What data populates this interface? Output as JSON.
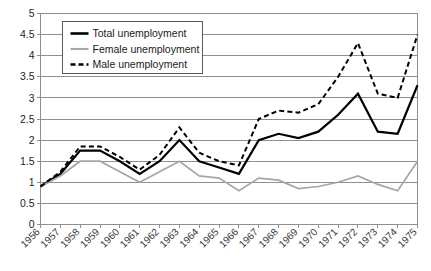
{
  "chart_data": {
    "type": "line",
    "title": "",
    "xlabel": "",
    "ylabel": "",
    "ylim": [
      0,
      5
    ],
    "ytick_step": 0.5,
    "grid": true,
    "legend_position": "top-left-inside",
    "categories": [
      "1956",
      "1957",
      "1958",
      "1959",
      "1960",
      "1961",
      "1962",
      "1963",
      "1964",
      "1965",
      "1966",
      "1967",
      "1968",
      "1969",
      "1970",
      "1971",
      "1972",
      "1973",
      "1974",
      "1975"
    ],
    "yticks": [
      "0",
      "0.5",
      "1",
      "1.5",
      "2",
      "2.5",
      "3",
      "3.5",
      "4",
      "4.5",
      "5"
    ],
    "series": [
      {
        "name": "Total unemployment",
        "color": "#000000",
        "style": "solid",
        "width": 2.2,
        "values": [
          0.9,
          1.2,
          1.75,
          1.75,
          1.5,
          1.2,
          1.5,
          2.0,
          1.5,
          1.35,
          1.2,
          2.0,
          2.15,
          2.05,
          2.2,
          2.6,
          3.1,
          2.2,
          2.15,
          3.3
        ]
      },
      {
        "name": "Female unemployment",
        "color": "#a6a6a6",
        "style": "solid",
        "width": 1.7,
        "values": [
          0.9,
          1.15,
          1.5,
          1.5,
          1.25,
          1.0,
          1.25,
          1.5,
          1.15,
          1.1,
          0.8,
          1.1,
          1.05,
          0.85,
          0.9,
          1.0,
          1.15,
          0.95,
          0.8,
          1.5
        ]
      },
      {
        "name": "Male unemployment",
        "color": "#000000",
        "style": "dashed",
        "width": 2.0,
        "values": [
          0.9,
          1.25,
          1.85,
          1.85,
          1.6,
          1.3,
          1.65,
          2.3,
          1.7,
          1.5,
          1.4,
          2.5,
          2.7,
          2.65,
          2.85,
          3.5,
          4.3,
          3.1,
          3.0,
          4.5
        ]
      }
    ]
  },
  "legend": {
    "entries": [
      {
        "label": "Total unemployment"
      },
      {
        "label": "Female unemployment"
      },
      {
        "label": "Male unemployment"
      }
    ]
  }
}
